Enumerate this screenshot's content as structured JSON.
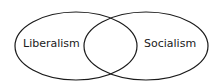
{
  "diagram": {
    "type": "venn",
    "sets": [
      {
        "label": "Liberalism"
      },
      {
        "label": "Socialism"
      }
    ],
    "intersection_label": "",
    "colors": {
      "stroke": "#1a1a1a",
      "fill": "#ffffff"
    }
  }
}
